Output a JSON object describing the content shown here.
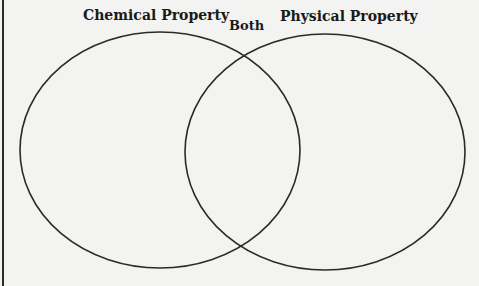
{
  "diagram": {
    "type": "venn",
    "labels": {
      "left": "Chemical Property",
      "middle": "Both",
      "right": "Physical Property"
    },
    "colors": {
      "stroke": "#2a2a2a",
      "background": "#f3f3f1"
    }
  }
}
